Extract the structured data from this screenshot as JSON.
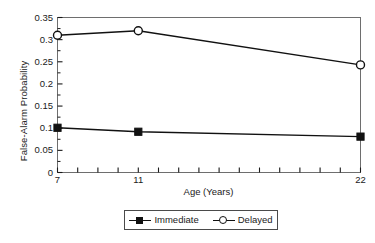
{
  "chart_data": {
    "type": "line",
    "title": "",
    "xlabel": "Age (Years)",
    "ylabel": "False-Alarm Probability",
    "x": [
      7,
      11,
      22
    ],
    "categories": [
      "7",
      "11",
      "22"
    ],
    "series": [
      {
        "name": "Immediate",
        "marker": "filled-square",
        "values": [
          0.101,
          0.092,
          0.081
        ]
      },
      {
        "name": "Delayed",
        "marker": "open-circle",
        "values": [
          0.31,
          0.32,
          0.243
        ]
      }
    ],
    "xlim": [
      7,
      22
    ],
    "ylim": [
      0,
      0.35
    ],
    "ytick_labels": [
      "0",
      "0.05",
      "0.1",
      "0.15",
      "0.2",
      "0.25",
      "0.3",
      "0.35"
    ],
    "ytick_values": [
      0,
      0.05,
      0.1,
      0.15,
      0.2,
      0.25,
      0.3,
      0.35
    ],
    "y_minor_step": 0.025,
    "xtick_labels": [
      "7",
      "11",
      "22"
    ],
    "xtick_label_values": [
      7,
      11,
      22
    ],
    "x_all_ticks": [
      7,
      8,
      9,
      10,
      11,
      12,
      13,
      14,
      15,
      16,
      17,
      18,
      19,
      20,
      21,
      22
    ],
    "grid": false,
    "legend_position": "below-axis-center",
    "line_color": "#111111",
    "frame_color": "#6e6e6e"
  },
  "legend": {
    "entries": [
      {
        "label": "Immediate",
        "glyph": "filled-square-with-line"
      },
      {
        "label": "Delayed",
        "glyph": "open-circle-with-line"
      }
    ]
  }
}
